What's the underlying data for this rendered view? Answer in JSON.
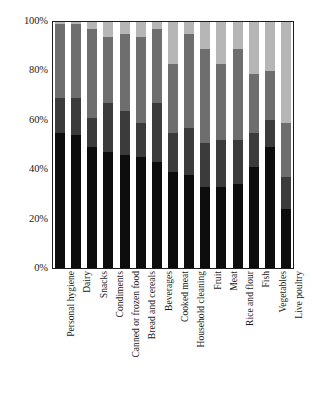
{
  "chart_data": {
    "type": "bar",
    "subtype": "stacked-100-percent-column",
    "title": "",
    "subtitle": "",
    "xlabel": "",
    "ylabel": "",
    "ylim": [
      0,
      100
    ],
    "yticks": [
      "0%",
      "20%",
      "40%",
      "60%",
      "80%",
      "100%"
    ],
    "ytick_values": [
      0,
      20,
      40,
      60,
      80,
      100
    ],
    "grid": false,
    "legend": "none",
    "stack_order": "bottom-to-top",
    "categories": [
      "Personal hygiene",
      "Dairy",
      "Snacks",
      "Condiments",
      "Canned or frozen food",
      "Bread and cereals",
      "Beverages",
      "Cooked meat",
      "Household cleaning",
      "Fruit",
      "Meat",
      "Rice and flour",
      "Fish",
      "Vegetables",
      "Live poultry"
    ],
    "series": [
      {
        "name": "series-1",
        "color": "#0d0d0d",
        "values": [
          55,
          54,
          49,
          47,
          46,
          45,
          43,
          39,
          38,
          33,
          33,
          34,
          41,
          49,
          24
        ]
      },
      {
        "name": "series-2",
        "color": "#3b3b3b",
        "values": [
          14,
          15,
          12,
          20,
          18,
          14,
          24,
          16,
          19,
          18,
          19,
          18,
          14,
          11,
          13
        ]
      },
      {
        "name": "series-3",
        "color": "#6e6e6e",
        "values": [
          30,
          30,
          36,
          27,
          31,
          35,
          30,
          28,
          38,
          38,
          31,
          37,
          24,
          20,
          22
        ]
      },
      {
        "name": "series-4",
        "color": "#b6b6b6",
        "values": [
          1,
          1,
          3,
          6,
          5,
          6,
          3,
          17,
          5,
          11,
          17,
          11,
          21,
          20,
          41
        ]
      }
    ]
  },
  "axis": {
    "y_tick_labels": [
      "100%",
      "80%",
      "60%",
      "40%",
      "20%",
      "0%"
    ]
  }
}
